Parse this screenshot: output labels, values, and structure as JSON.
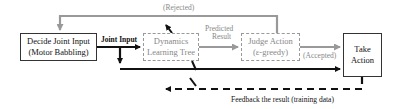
{
  "diagram": {
    "nodes": {
      "decide": {
        "line1": "Decide Joint Input",
        "line2": "(Motor Babbling)"
      },
      "dynamics": {
        "line1": "Dynamics",
        "line2": "Learning Tree"
      },
      "judge": {
        "line1": "Judge Action",
        "line2": "(ε-greedy)"
      },
      "take": {
        "line1": "Take",
        "line2": "Action"
      }
    },
    "edges": {
      "joint_input": "Joint Input",
      "predicted_result_1": "Predicted",
      "predicted_result_2": "Result",
      "rejected": "(Rejected)",
      "accepted": "(Accepted)",
      "feedback": "Feedback the result (training data)"
    },
    "colors": {
      "solid": "#111111",
      "grey": "#999999"
    }
  }
}
